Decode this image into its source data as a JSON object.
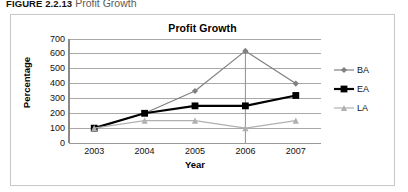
{
  "figure": {
    "label": "FIGURE 2.2.13",
    "caption": "Profit Growth"
  },
  "legend": {
    "position": "right",
    "entries": [
      {
        "label": "BA",
        "marker": "diamond-marker",
        "color": "#808080"
      },
      {
        "label": "EA",
        "marker": "square-marker",
        "color": "#000000"
      },
      {
        "label": "LA",
        "marker": "triangle-marker",
        "color": "#b0b0b0"
      }
    ]
  },
  "chart_data": {
    "type": "line",
    "title": "Profit Growth",
    "xlabel": "Year",
    "ylabel": "Percentage",
    "categories": [
      "2003",
      "2004",
      "2005",
      "2006",
      "2007"
    ],
    "ylim": [
      0,
      700
    ],
    "ytick_values": [
      0,
      100,
      200,
      300,
      400,
      500,
      600,
      700
    ],
    "ytick_labels": [
      "0",
      "100",
      "200",
      "300",
      "400",
      "500",
      "600",
      "700"
    ],
    "grid": "horizontal",
    "legend_position": "right",
    "series": [
      {
        "name": "BA",
        "color": "#808080",
        "marker": "diamond",
        "values": [
          100,
          200,
          350,
          620,
          400
        ]
      },
      {
        "name": "EA",
        "color": "#000000",
        "marker": "square",
        "values": [
          100,
          200,
          250,
          250,
          320
        ]
      },
      {
        "name": "LA",
        "color": "#b0b0b0",
        "marker": "triangle",
        "values": [
          100,
          150,
          150,
          100,
          150
        ]
      }
    ]
  }
}
